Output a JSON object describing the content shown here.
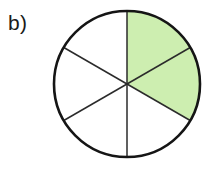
{
  "figure": {
    "part_label": "b)",
    "shape": "circle"
  },
  "colors": {
    "shaded_fill": "#cdeeb0",
    "unshaded_fill": "#ffffff",
    "outline": "#151515",
    "divider_line": "#2b2b2b",
    "background": "#ffffff",
    "label_text": "#1a1a1a"
  },
  "chart_data": {
    "type": "pie",
    "title": "",
    "subtitle": "",
    "xlabel": "",
    "ylabel": "",
    "total_slices": 6,
    "shaded_slices": 2,
    "fraction_shaded": "2/6",
    "fraction_decimal": 0.3333,
    "slice_angle_degrees": 60,
    "legend_position": "none",
    "grid": false,
    "categories": [
      "1",
      "2",
      "3",
      "4",
      "5",
      "6"
    ],
    "values": [
      1,
      1,
      1,
      1,
      1,
      1
    ],
    "slices": [
      {
        "index": 1,
        "start_deg": 0,
        "end_deg": 60,
        "shaded": true,
        "fill": "#cdeeb0"
      },
      {
        "index": 2,
        "start_deg": 60,
        "end_deg": 120,
        "shaded": true,
        "fill": "#cdeeb0"
      },
      {
        "index": 3,
        "start_deg": 120,
        "end_deg": 180,
        "shaded": false,
        "fill": "#ffffff"
      },
      {
        "index": 4,
        "start_deg": 180,
        "end_deg": 240,
        "shaded": false,
        "fill": "#ffffff"
      },
      {
        "index": 5,
        "start_deg": 240,
        "end_deg": 300,
        "shaded": false,
        "fill": "#ffffff"
      },
      {
        "index": 6,
        "start_deg": 300,
        "end_deg": 360,
        "shaded": false,
        "fill": "#ffffff"
      }
    ],
    "geometry": {
      "center_x": 127,
      "center_y": 84,
      "radius": 73,
      "outline_width": 2.6,
      "divider_width": 1.5
    }
  }
}
